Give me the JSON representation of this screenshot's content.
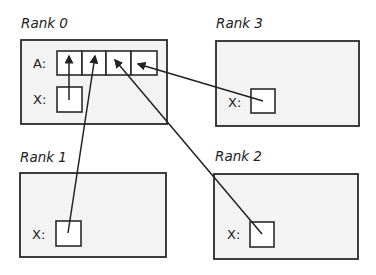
{
  "diagram": {
    "ranks": [
      {
        "id": "rank0",
        "title": "Rank 0",
        "labels": {
          "array": "A:",
          "var": "X:"
        }
      },
      {
        "id": "rank1",
        "title": "Rank 1",
        "labels": {
          "var": "X:"
        }
      },
      {
        "id": "rank2",
        "title": "Rank 2",
        "labels": {
          "var": "X:"
        }
      },
      {
        "id": "rank3",
        "title": "Rank 3",
        "labels": {
          "var": "X:"
        }
      }
    ],
    "array_cells": 4,
    "arrows": [
      {
        "from": "rank0.X",
        "to": "rank0.A[0]"
      },
      {
        "from": "rank1.X",
        "to": "rank0.A[1]"
      },
      {
        "from": "rank2.X",
        "to": "rank0.A[2]"
      },
      {
        "from": "rank3.X",
        "to": "rank0.A[3]"
      }
    ],
    "colors": {
      "box_fill": "#f3f3f3",
      "stroke": "#2a2a2a",
      "cell_fill": "#ffffff"
    }
  }
}
